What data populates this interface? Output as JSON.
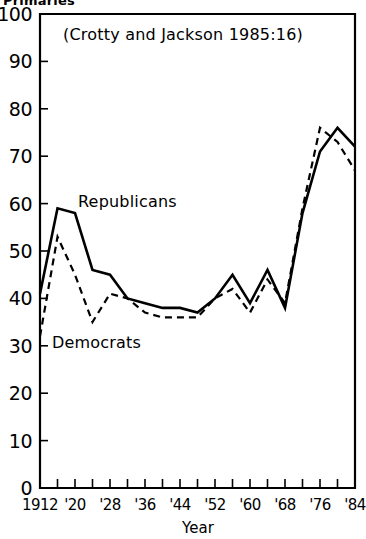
{
  "figure": {
    "clipped_top_label": "Primaries",
    "title": "(Crotty and Jackson  1985:16)",
    "xlabel": "Year",
    "republicans_label": "Republicans",
    "democrats_label": "Democrats"
  },
  "axes": {
    "y_ticks": [
      "100",
      "90",
      "80",
      "70",
      "60",
      "50",
      "40",
      "30",
      "20",
      "10",
      "0"
    ],
    "x_ticks": [
      "1912",
      "'20",
      "'28",
      "'36",
      "'44",
      "'52",
      "'60",
      "'68",
      "'76",
      "'84"
    ]
  },
  "chart_data": {
    "type": "line",
    "title": "(Crotty and Jackson  1985:16)",
    "xlabel": "Year",
    "ylabel": "Primaries",
    "xlim": [
      1912,
      1984
    ],
    "ylim": [
      0,
      100
    ],
    "ytick_values": [
      0,
      10,
      20,
      30,
      40,
      50,
      60,
      70,
      80,
      90,
      100
    ],
    "xtick_values": [
      1912,
      1920,
      1928,
      1936,
      1944,
      1952,
      1960,
      1968,
      1976,
      1984
    ],
    "grid": false,
    "legend": "inline-annotations",
    "x": [
      1912,
      1916,
      1920,
      1924,
      1928,
      1932,
      1936,
      1940,
      1944,
      1948,
      1952,
      1956,
      1960,
      1964,
      1968,
      1972,
      1976,
      1980,
      1984
    ],
    "series": [
      {
        "name": "Republicans",
        "style": "solid",
        "values": [
          41,
          59,
          58,
          46,
          45,
          40,
          39,
          38,
          38,
          37,
          40,
          45,
          39,
          46,
          38,
          58,
          71,
          76,
          72
        ]
      },
      {
        "name": "Democrats",
        "style": "dashed",
        "values": [
          32,
          53,
          45,
          35,
          41,
          40,
          37,
          36,
          36,
          36,
          40,
          42,
          37,
          44,
          39,
          59,
          76,
          73,
          67
        ]
      }
    ]
  },
  "colors": {
    "ink": "#000000",
    "background": "#ffffff"
  }
}
